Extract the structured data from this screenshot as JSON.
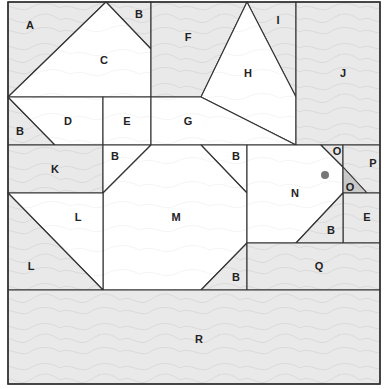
{
  "diagram": {
    "type": "tangram-style puzzle of labeled polygonal pieces with topographic texture",
    "colors": {
      "outline": "#333333",
      "shaded_fill": "#e9e9e9",
      "white_fill": "#ffffff",
      "dark_fill": "#c8c8c8",
      "contour": "#cfcfcf",
      "dot": "#777777"
    },
    "pieces": [
      {
        "label": "A",
        "shade": "shaded",
        "points": "8,2 106,2 8,97",
        "lx": 30,
        "ly": 26
      },
      {
        "label": "B",
        "shade": "shaded",
        "points": "106,2 151,2 151,49",
        "lx": 139,
        "ly": 15
      },
      {
        "label": "C",
        "shade": "white",
        "points": "106,2 151,49 151,97 8,97",
        "lx": 104,
        "ly": 61
      },
      {
        "label": "F",
        "shade": "shaded",
        "points": "151,2 247,2 201,97 151,97",
        "lx": 188,
        "ly": 38
      },
      {
        "label": "I",
        "shade": "shaded",
        "points": "247,2 296,2 296,97",
        "lx": 278,
        "ly": 21
      },
      {
        "label": "H",
        "shade": "white",
        "points": "247,2 296,97 296,145 201,97",
        "lx": 248,
        "ly": 74
      },
      {
        "label": "J",
        "shade": "shaded",
        "points": "296,2 380,2 380,145 296,145",
        "lx": 343,
        "ly": 74
      },
      {
        "label": "B",
        "shade": "shaded",
        "points": "8,97 55,145 8,145",
        "lx": 20,
        "ly": 132
      },
      {
        "label": "D",
        "shade": "white",
        "points": "8,97 103,97 103,145 55,145",
        "lx": 68,
        "ly": 122
      },
      {
        "label": "E",
        "shade": "white",
        "points": "103,97 151,97 151,145 103,145",
        "lx": 127,
        "ly": 122
      },
      {
        "label": "G",
        "shade": "white",
        "points": "151,97 201,97 296,145 151,145",
        "lx": 188,
        "ly": 122
      },
      {
        "label": "K",
        "shade": "shaded",
        "points": "8,145 103,145 103,193 8,193",
        "lx": 55,
        "ly": 170
      },
      {
        "label": "B",
        "shade": "white",
        "points": "103,145 151,145 103,193",
        "lx": 115,
        "ly": 157
      },
      {
        "label": "B",
        "shade": "white",
        "points": "201,145 247,145 247,193",
        "lx": 236,
        "ly": 157
      },
      {
        "label": "M",
        "shade": "white",
        "points": "151,145 201,145 247,193 247,243 201,290 103,290 103,193",
        "lx": 176,
        "ly": 218
      },
      {
        "label": "L",
        "shade": "white",
        "points": "8,193 103,193 103,290",
        "lx": 78,
        "ly": 218
      },
      {
        "label": "L",
        "shade": "shaded",
        "points": "8,193 103,290 8,290",
        "lx": 31,
        "ly": 267
      },
      {
        "label": "N",
        "shade": "white",
        "points": "247,145 321,145 343,167 343,193 296,243 247,243",
        "lx": 295,
        "ly": 194
      },
      {
        "label": "O",
        "shade": "shaded",
        "points": "321,145 343,145 343,167",
        "lx": 337,
        "ly": 152
      },
      {
        "label": "P",
        "shade": "shaded",
        "points": "343,145 380,145 380,193 367,193 343,167",
        "lx": 373,
        "ly": 164
      },
      {
        "label": "O",
        "shade": "dark",
        "points": "343,167 367,193 343,193",
        "lx": 350,
        "ly": 188
      },
      {
        "label": "E",
        "shade": "shaded",
        "points": "343,193 380,193 380,243 343,243",
        "lx": 367,
        "ly": 218
      },
      {
        "label": "B",
        "shade": "shaded",
        "points": "343,193 343,243 296,243",
        "lx": 331,
        "ly": 231
      },
      {
        "label": "B",
        "shade": "shaded",
        "points": "247,243 247,290 201,290",
        "lx": 236,
        "ly": 278
      },
      {
        "label": "Q",
        "shade": "shaded",
        "points": "247,243 380,243 380,290 247,290",
        "lx": 319,
        "ly": 267
      },
      {
        "label": "R",
        "shade": "shaded",
        "points": "8,290 380,290 380,384 8,384",
        "lx": 199,
        "ly": 340
      }
    ],
    "marker": {
      "name": "dot",
      "cx": 325,
      "cy": 175,
      "r": 4
    }
  }
}
